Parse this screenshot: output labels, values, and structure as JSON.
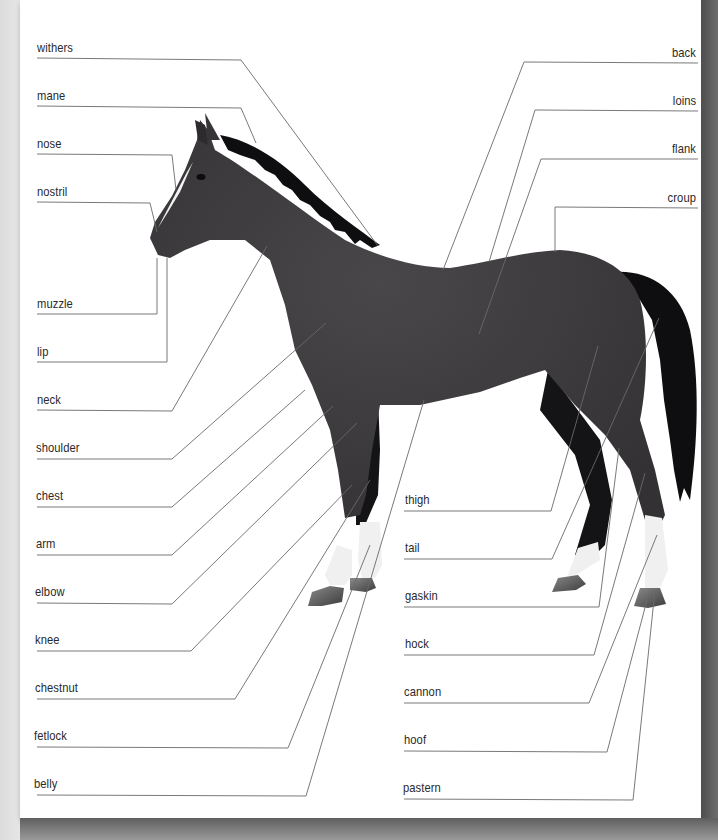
{
  "diagram": {
    "colors": {
      "coat": "#3d3b3e",
      "mane_tail": "#0e0e10",
      "markings": "#f2f2f2",
      "hoof": "#5a5a5a",
      "leader_line": "#6a6a6a",
      "label_text": "#2a2a2a"
    },
    "labels_left": [
      {
        "text": "withers",
        "y": 48
      },
      {
        "text": "mane",
        "y": 96
      },
      {
        "text": "nose",
        "y": 145
      },
      {
        "text": "nostril",
        "y": 193
      },
      {
        "text": "muzzle",
        "y": 305
      },
      {
        "text": "lip",
        "y": 353
      },
      {
        "text": "neck",
        "y": 401
      },
      {
        "text": "shoulder",
        "y": 449
      },
      {
        "text": "chest",
        "y": 497
      },
      {
        "text": "arm",
        "y": 545
      },
      {
        "text": "elbow",
        "y": 593
      },
      {
        "text": "knee",
        "y": 641
      },
      {
        "text": "chestnut",
        "y": 689
      },
      {
        "text": "fetlock",
        "y": 737
      },
      {
        "text": "belly",
        "y": 785
      }
    ],
    "labels_right": [
      {
        "text": "back",
        "y": 55
      },
      {
        "text": "loins",
        "y": 103
      },
      {
        "text": "flank",
        "y": 151
      },
      {
        "text": "croup",
        "y": 199
      }
    ],
    "labels_lower_right": [
      {
        "text": "thigh",
        "y": 500
      },
      {
        "text": "tail",
        "y": 548
      },
      {
        "text": "gaskin",
        "y": 596
      },
      {
        "text": "hock",
        "y": 644
      },
      {
        "text": "cannon",
        "y": 692
      },
      {
        "text": "hoof",
        "y": 740
      },
      {
        "text": "pastern",
        "y": 788
      }
    ]
  }
}
